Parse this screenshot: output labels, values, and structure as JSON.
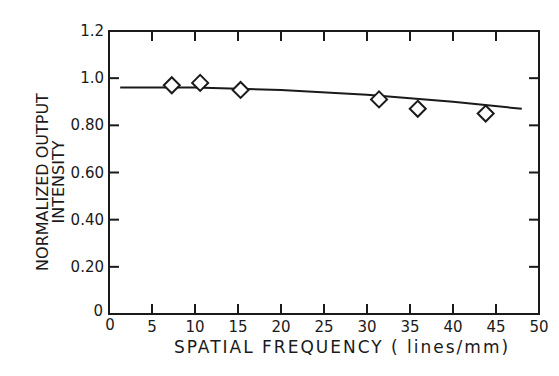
{
  "chart_data": {
    "type": "scatter",
    "title": "",
    "xlabel": "SPATIAL FREQUENCY ( lines/mm)",
    "ylabel": [
      "NORMALIZED OUTPUT",
      "INTENSITY"
    ],
    "xlim": [
      0,
      50
    ],
    "ylim": [
      0,
      1.2
    ],
    "x_ticks": [
      0,
      5,
      10,
      15,
      20,
      25,
      30,
      35,
      40,
      45,
      50
    ],
    "x_tick_labels": [
      "0",
      "5",
      "10",
      "15",
      "20",
      "25",
      "30",
      "35",
      "40",
      "45",
      "50"
    ],
    "y_ticks": [
      0,
      0.2,
      0.4,
      0.6,
      0.8,
      1.0,
      1.2
    ],
    "y_tick_labels": [
      "0",
      "0.20",
      "0.40",
      "0.60",
      "0.80",
      "1.0",
      "1.2"
    ],
    "grid": false,
    "legend": null,
    "series": [
      {
        "name": "measured",
        "marker": "diamond-open",
        "x": [
          7.3,
          10.6,
          15.3,
          31.4,
          35.9,
          43.8
        ],
        "y": [
          0.97,
          0.98,
          0.95,
          0.91,
          0.87,
          0.85
        ]
      },
      {
        "name": "fit-curve",
        "style": "line",
        "x": [
          1.3,
          10,
          20,
          30,
          40,
          48
        ],
        "y": [
          0.96,
          0.96,
          0.95,
          0.93,
          0.9,
          0.87
        ]
      }
    ]
  },
  "colors": {
    "ink": "#1a1a1a",
    "background": "#ffffff"
  }
}
